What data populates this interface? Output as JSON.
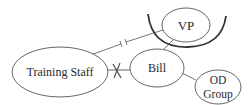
{
  "diagram": {
    "type": "relationship-map",
    "colors": {
      "stroke": "#555555",
      "text": "#2a2a2a",
      "background": "#ffffff",
      "arc": "#333333"
    },
    "nodes": [
      {
        "id": "training-staff",
        "label": "Training Staff"
      },
      {
        "id": "bill",
        "label": "Bill"
      },
      {
        "id": "vp",
        "label": "VP"
      },
      {
        "id": "od-group",
        "label_line1": "OD",
        "label_line2": "Group"
      }
    ],
    "edges": [
      {
        "from": "training-staff",
        "to": "vp",
        "style": "broken (double tick)"
      },
      {
        "from": "training-staff",
        "to": "bill",
        "style": "blocked (X)"
      },
      {
        "from": "bill",
        "to": "vp",
        "style": "plain"
      },
      {
        "from": "bill",
        "to": "od-group",
        "style": "plain"
      }
    ],
    "annotations": [
      {
        "id": "vp-arc",
        "description": "thick arc beneath VP node"
      }
    ]
  }
}
